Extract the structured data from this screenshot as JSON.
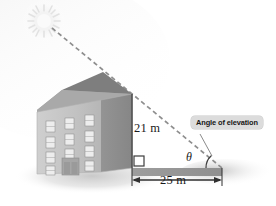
{
  "figure": {
    "kind": "trigonometry-diagram",
    "background_color": "#ffffff"
  },
  "labels": {
    "height": "21 m",
    "base": "25 m",
    "angle_symbol": "θ",
    "callout": "Angle of elevation"
  },
  "colors": {
    "building_front": "#c3c3c3",
    "building_side": "#8e8e8e",
    "roof_left": "#a8a8a8",
    "roof_right": "#7c7c7c",
    "ground_band": "#9a9a9a",
    "shadow": "#d4d4d4",
    "line": "#4a4a4a",
    "dashed_ray": "#8a8a8a",
    "callout_fill": "#dcdcdc",
    "sun": "#f2f2f2",
    "text": "#1a1a1a"
  },
  "geometry": {
    "apex_x": 132,
    "apex_y": 94,
    "corner_x": 132,
    "corner_y": 168,
    "ray_end_x": 222,
    "ray_end_y": 168,
    "sun_x": 44,
    "sun_y": 21,
    "height_meters": 21,
    "base_meters": 25
  },
  "icons": {
    "sun": "sun-icon",
    "building": "building-icon",
    "right_angle": "right-angle-marker-icon",
    "angle_arc": "angle-arc-icon"
  }
}
